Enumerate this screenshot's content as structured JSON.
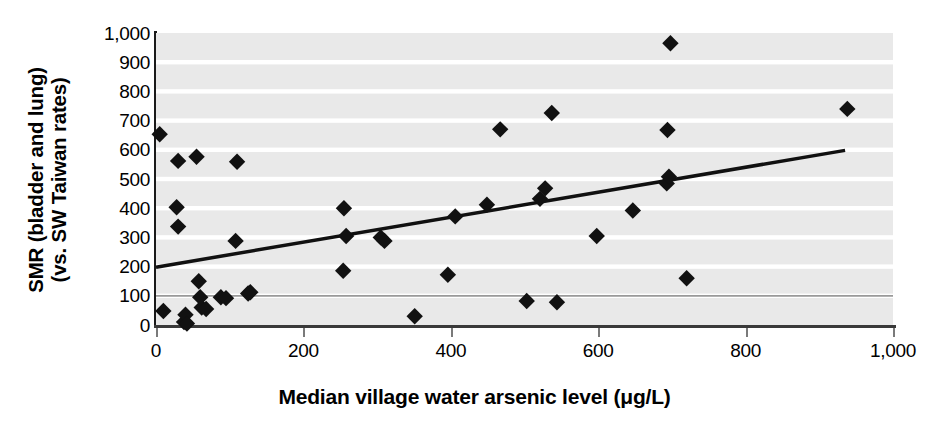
{
  "chart_data": {
    "type": "scatter",
    "title": "",
    "xlabel": "Median village water arsenic level (μg/L)",
    "ylabel_line1": "SMR (bladder and lung)",
    "ylabel_line2": "(vs. SW Taiwan rates)",
    "xlim": [
      0,
      1000
    ],
    "ylim": [
      0,
      1000
    ],
    "xticks": [
      0,
      200,
      400,
      600,
      800,
      1000
    ],
    "xticklabels": [
      "0",
      "200",
      "400",
      "600",
      "800",
      "1,000"
    ],
    "yticks": [
      0,
      100,
      200,
      300,
      400,
      500,
      600,
      700,
      800,
      900,
      1000
    ],
    "yticklabels": [
      "0",
      "100",
      "200",
      "300",
      "400",
      "500",
      "600",
      "700",
      "800",
      "900",
      "1,000"
    ],
    "grid": "horizontal-bands",
    "reference_line_y": 100,
    "legend": "none",
    "marker": "diamond",
    "marker_color": "#111111",
    "plot_background": "#e9e9e9",
    "gridline_color": "#ffffff",
    "reference_line_color": "#9a9a9a",
    "points": [
      {
        "x": 5,
        "y": 653
      },
      {
        "x": 10,
        "y": 48
      },
      {
        "x": 28,
        "y": 403
      },
      {
        "x": 30,
        "y": 562
      },
      {
        "x": 30,
        "y": 337
      },
      {
        "x": 38,
        "y": 10
      },
      {
        "x": 40,
        "y": 35
      },
      {
        "x": 42,
        "y": 5
      },
      {
        "x": 55,
        "y": 576
      },
      {
        "x": 58,
        "y": 150
      },
      {
        "x": 60,
        "y": 95
      },
      {
        "x": 62,
        "y": 60
      },
      {
        "x": 68,
        "y": 55
      },
      {
        "x": 88,
        "y": 95
      },
      {
        "x": 95,
        "y": 92
      },
      {
        "x": 108,
        "y": 288
      },
      {
        "x": 110,
        "y": 559
      },
      {
        "x": 125,
        "y": 108
      },
      {
        "x": 128,
        "y": 112
      },
      {
        "x": 254,
        "y": 186
      },
      {
        "x": 255,
        "y": 400
      },
      {
        "x": 258,
        "y": 305
      },
      {
        "x": 305,
        "y": 300
      },
      {
        "x": 310,
        "y": 288
      },
      {
        "x": 351,
        "y": 30
      },
      {
        "x": 396,
        "y": 172
      },
      {
        "x": 406,
        "y": 372
      },
      {
        "x": 449,
        "y": 412
      },
      {
        "x": 467,
        "y": 670
      },
      {
        "x": 503,
        "y": 82
      },
      {
        "x": 521,
        "y": 432
      },
      {
        "x": 528,
        "y": 468
      },
      {
        "x": 537,
        "y": 726
      },
      {
        "x": 544,
        "y": 78
      },
      {
        "x": 598,
        "y": 305
      },
      {
        "x": 647,
        "y": 392
      },
      {
        "x": 693,
        "y": 485
      },
      {
        "x": 696,
        "y": 508
      },
      {
        "x": 694,
        "y": 668
      },
      {
        "x": 698,
        "y": 965
      },
      {
        "x": 720,
        "y": 160
      },
      {
        "x": 938,
        "y": 740
      }
    ],
    "trendline": {
      "x_start": 0,
      "y_start": 198,
      "x_end": 935,
      "y_end": 598,
      "color": "#111111",
      "width": 3.5
    }
  }
}
